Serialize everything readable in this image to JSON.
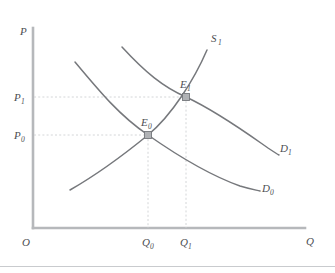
{
  "figure": {
    "kind": "supply-demand-shift-diagram",
    "axes": {
      "y_axis_label": "P",
      "x_axis_label": "Q",
      "origin_label": "O"
    },
    "price_ticks": [
      {
        "base": "P",
        "sub": "1",
        "y": 97
      },
      {
        "base": "P",
        "sub": "0",
        "y": 135
      }
    ],
    "quantity_ticks": [
      {
        "base": "Q",
        "sub": "0",
        "x": 148
      },
      {
        "base": "Q",
        "sub": "1",
        "x": 186
      }
    ],
    "curves": [
      {
        "name": "supply",
        "base": "S",
        "sub": "1",
        "label_x": 211,
        "label_y": 42
      },
      {
        "name": "demand-initial",
        "base": "D",
        "sub": "0",
        "label_x": 262,
        "label_y": 192
      },
      {
        "name": "demand-shifted",
        "base": "D",
        "sub": "1",
        "label_x": 280,
        "label_y": 152
      }
    ],
    "equilibria": [
      {
        "name": "equilibrium-initial",
        "base": "E",
        "sub": "0",
        "x": 148,
        "y": 135,
        "label_x": 141,
        "label_y": 126
      },
      {
        "name": "equilibrium-new",
        "base": "E",
        "sub": "1",
        "x": 186,
        "y": 97,
        "label_x": 180,
        "label_y": 88
      }
    ],
    "colors": {
      "curve": "#76787c",
      "axis": "#b6b8bb",
      "guide": "#cfd1d4",
      "marker_fill": "#b0b2b5",
      "text": "#4c4e52",
      "background": "#ffffff"
    }
  }
}
